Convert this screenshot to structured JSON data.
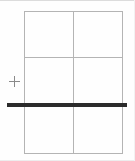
{
  "figure": {
    "title": "",
    "canvas": {
      "width": 135,
      "height": 161,
      "background": "#fefefe"
    }
  },
  "grid": {
    "name": "table-grid",
    "columns": 2,
    "rows": 3,
    "line_color": "#b4b4b4",
    "line_width_px": 1,
    "bounds": {
      "left": 24,
      "top": 11,
      "width": 99,
      "height": 143
    },
    "column_divider_x": [
      73
    ],
    "row_divider_y": [
      57,
      105
    ],
    "cells": [
      {
        "row": 1,
        "col": 1,
        "text": ""
      },
      {
        "row": 1,
        "col": 2,
        "text": ""
      },
      {
        "row": 2,
        "col": 1,
        "text": ""
      },
      {
        "row": 2,
        "col": 2,
        "text": ""
      },
      {
        "row": 3,
        "col": 1,
        "text": ""
      },
      {
        "row": 3,
        "col": 2,
        "text": ""
      }
    ]
  },
  "bold_rule": {
    "name": "bold-horizontal-rule",
    "color": "#2b2b2b",
    "thickness_px": 4,
    "x_start": 7,
    "x_end": 127,
    "y_center": 105,
    "label": ""
  },
  "marker": {
    "name": "plus-marker",
    "glyph": "plus-icon",
    "color": "#8a8a8a",
    "size_px": 11,
    "center": {
      "x": 14,
      "y": 81
    },
    "label": ""
  },
  "frame": {
    "top_color": "#dcdcdc",
    "bottom_color": "#ededed",
    "right_color": "#f2f2f2"
  }
}
